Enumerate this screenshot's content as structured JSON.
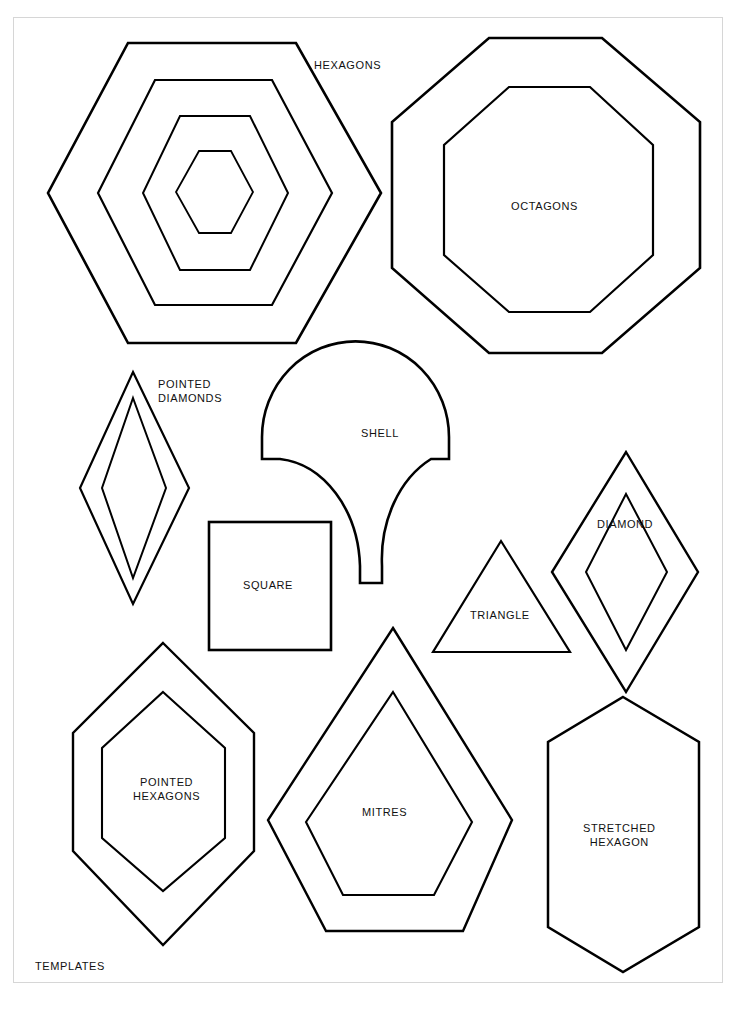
{
  "document": {
    "kind": "scanned-template-sheet",
    "footer_label": "TEMPLATES",
    "background_color": "#ffffff",
    "ink_color": "#000000",
    "sheet_border_color": "#d6d6d6"
  },
  "labels": {
    "hexagons": "HEXAGONS",
    "octagons": "OCTAGONS",
    "pointed_diamonds": "POINTED\nDIAMONDS",
    "shell": "SHELL",
    "square": "SQUARE",
    "diamond": "DIAMOND",
    "triangle": "TRIANGLE",
    "pointed_hexagons": "POINTED\nHEXAGONS",
    "mitres": "MITRES",
    "stretched_hexagon": "STRETCHED\nHEXAGON",
    "templates": "TEMPLATES"
  },
  "shapes": [
    {
      "id": "hexagons",
      "name": "HEXAGONS",
      "count": 4,
      "description": "four concentric flat-top hexagons",
      "outlines": [
        "128,43 296,43 381,193 296,343 128,343 48,193",
        "155,80 272,80 332,193 272,305 155,305 98,193",
        "180,116 250,116 288,193 250,270 180,270 143,193",
        "199,151 231,151 253,192 231,233 199,233 176,192"
      ]
    },
    {
      "id": "octagons",
      "name": "OCTAGONS",
      "count": 2,
      "description": "two concentric regular octagons",
      "outlines": [
        "489,38 602,38 700,122 700,268 602,353 489,353 392,268 392,122",
        "509,87 590,87 653,145 653,255 590,312 509,312 444,255 444,145"
      ]
    },
    {
      "id": "pointed-diamonds",
      "name": "POINTED DIAMONDS",
      "count": 2,
      "description": "two concentric elongated pointed diamonds",
      "outlines": [
        "133,372 189,488 133,604 80,488",
        "133,398 166,488 133,578 102,488"
      ]
    },
    {
      "id": "shell",
      "name": "SHELL",
      "count": 1,
      "description": "clamshell / fan template with domed top and flared stem"
    },
    {
      "id": "square",
      "name": "SQUARE",
      "count": 1,
      "description": "single square",
      "rect": {
        "x": 209,
        "y": 522,
        "width": 122,
        "height": 128
      }
    },
    {
      "id": "diamond",
      "name": "DIAMOND",
      "count": 2,
      "description": "two concentric diamonds",
      "outlines": [
        "626,452 698,572 626,692 552,572",
        "626,494 667,572 626,650 586,572"
      ]
    },
    {
      "id": "triangle",
      "name": "TRIANGLE",
      "count": 1,
      "description": "single equilateral triangle",
      "outlines": [
        "501,541 570,652 433,652"
      ]
    },
    {
      "id": "pointed-hexagons",
      "name": "POINTED HEXAGONS",
      "count": 2,
      "description": "two concentric pointed (elongated) hexagons",
      "outlines": [
        "163,643 254,733 254,851 163,945 73,851 73,733",
        "163,692 225,748 225,838 163,891 102,838 102,748"
      ]
    },
    {
      "id": "mitres",
      "name": "MITRES",
      "count": 2,
      "description": "two concentric mitre / pentagon-kite shapes",
      "outlines": [
        "393,628 512,820 463,931 326,931 268,820",
        "393,692 472,822 434,895 343,895 306,822"
      ]
    },
    {
      "id": "stretched-hexagon",
      "name": "STRETCHED HEXAGON",
      "count": 1,
      "description": "single vertically stretched hexagon",
      "outlines": [
        "623,697 699,742 699,927 623,972 548,927 548,742"
      ]
    }
  ],
  "label_positions": {
    "hexagons": {
      "x": 314,
      "y": 59
    },
    "octagons": {
      "x": 511,
      "y": 200
    },
    "pointed_diamonds": {
      "x": 158,
      "y": 378
    },
    "shell": {
      "x": 361,
      "y": 427
    },
    "square": {
      "x": 243,
      "y": 579
    },
    "diamond": {
      "x": 597,
      "y": 518
    },
    "triangle": {
      "x": 470,
      "y": 609
    },
    "pointed_hexagons": {
      "x": 133,
      "y": 776
    },
    "mitres": {
      "x": 362,
      "y": 806
    },
    "stretched_hexagon": {
      "x": 583,
      "y": 822
    },
    "templates": {
      "x": 35,
      "y": 960
    }
  }
}
